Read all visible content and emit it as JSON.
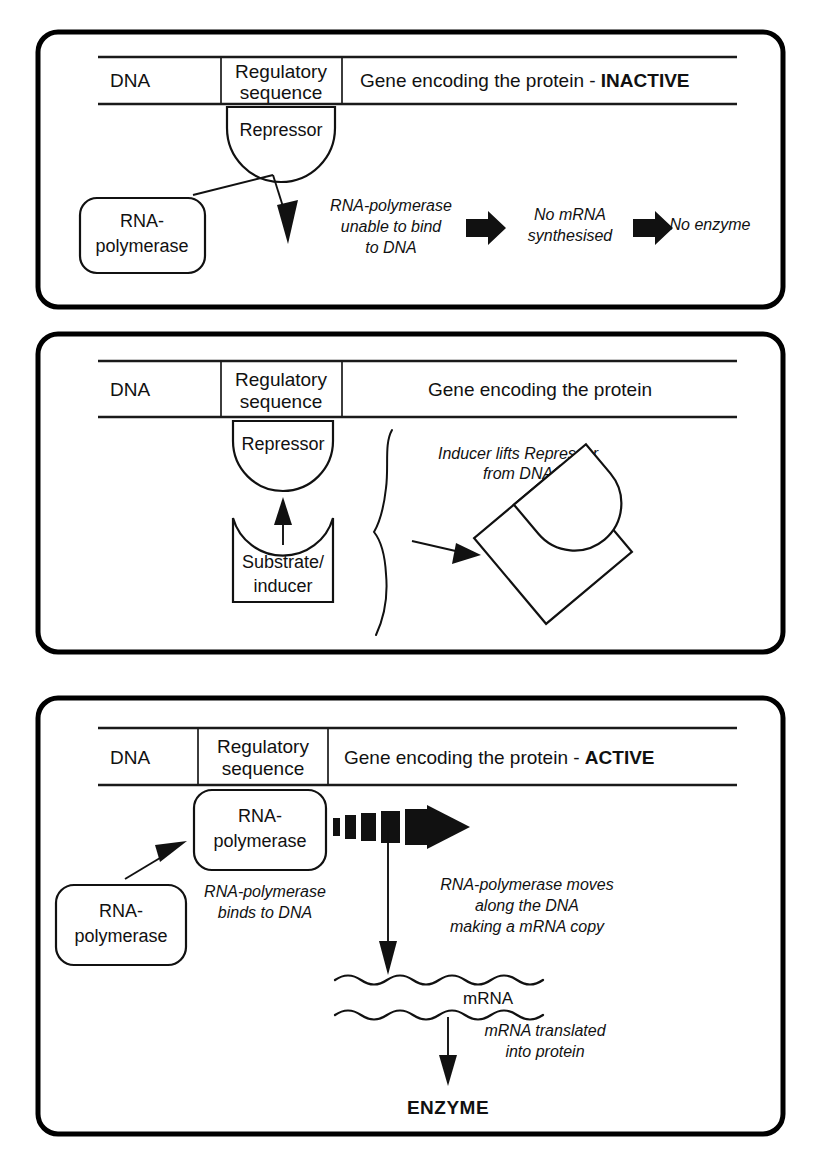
{
  "diagram": {
    "panels": [
      {
        "id": "panel-inactive",
        "dna_bar": {
          "segments": [
            {
              "label": "DNA"
            },
            {
              "label_line1": "Regulatory",
              "label_line2": "sequence"
            },
            {
              "label": "Gene encoding the protein - ",
              "emphasis": "INACTIVE"
            }
          ]
        },
        "repressor_label": "Repressor",
        "polymerase_box": {
          "line1": "RNA-",
          "line2": "polymerase"
        },
        "flow": [
          {
            "line1": "RNA-polymerase",
            "line2": "unable to bind",
            "line3": "to DNA"
          },
          {
            "line1": "No mRNA",
            "line2": "synthesised"
          },
          {
            "line1": "No enzyme"
          }
        ],
        "arrow_icons": [
          "block-arrow-right",
          "block-arrow-right"
        ]
      },
      {
        "id": "panel-induction",
        "dna_bar": {
          "segments": [
            {
              "label": "DNA"
            },
            {
              "label_line1": "Regulatory",
              "label_line2": "sequence"
            },
            {
              "label": "Gene encoding the protein",
              "emphasis": ""
            }
          ]
        },
        "repressor_label": "Repressor",
        "inducer_box": {
          "line1": "Substrate/",
          "line2": "inducer"
        },
        "annotation": {
          "line1": "Inducer lifts Repressor",
          "line2": "from DNA"
        }
      },
      {
        "id": "panel-active",
        "dna_bar": {
          "segments": [
            {
              "label": "DNA"
            },
            {
              "label_line1": "Regulatory",
              "label_line2": "sequence"
            },
            {
              "label": "Gene encoding the protein - ",
              "emphasis": "ACTIVE"
            }
          ]
        },
        "polymerase_bound_box": {
          "line1": "RNA-",
          "line2": "polymerase"
        },
        "polymerase_free_box": {
          "line1": "RNA-",
          "line2": "polymerase"
        },
        "binds_note": {
          "line1": "RNA-polymerase",
          "line2": "binds to DNA"
        },
        "moves_note": {
          "line1": "RNA-polymerase moves",
          "line2": "along the DNA",
          "line3": "making a mRNA copy"
        },
        "mrna_label": "mRNA",
        "translate_note": {
          "line1": "mRNA translated",
          "line2": "into protein"
        },
        "product_label": "ENZYME"
      }
    ],
    "colors": {
      "ink": "#111111",
      "panel_border": "#000000",
      "background": "#ffffff"
    }
  }
}
